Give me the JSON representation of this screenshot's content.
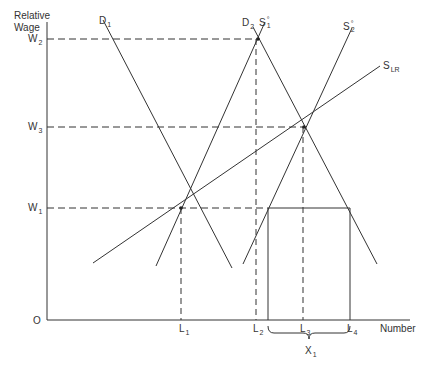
{
  "axes": {
    "y_label_line1": "Relative",
    "y_label_line2": "Wage",
    "x_label": "Number",
    "origin": "O"
  },
  "wage_levels": [
    {
      "name": "W",
      "sub": "2"
    },
    {
      "name": "W",
      "sub": "3"
    },
    {
      "name": "W",
      "sub": "1"
    }
  ],
  "quantity_levels": [
    {
      "name": "L",
      "sub": "1"
    },
    {
      "name": "L",
      "sub": "2"
    },
    {
      "name": "L",
      "sub": "3"
    },
    {
      "name": "L",
      "sub": "4"
    }
  ],
  "curves": {
    "d1": {
      "name": "D",
      "sub": "1"
    },
    "d2": {
      "name": "D",
      "sub": "2"
    },
    "s1": {
      "name": "S",
      "sup": "s",
      "sub": "1"
    },
    "s2": {
      "name": "S",
      "sup": "s",
      "sub": "2"
    },
    "slr": {
      "name": "S",
      "sub": "LR"
    }
  },
  "bracket": {
    "name": "X",
    "sub": "1"
  },
  "colors": {
    "line": "#333333",
    "text": "#333333"
  }
}
